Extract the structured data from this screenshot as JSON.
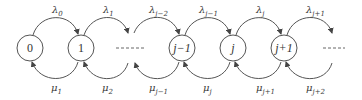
{
  "diagram": {
    "type": "birth-death-state-transition",
    "nodes": [
      {
        "id": "n0",
        "label": "0",
        "italic": false
      },
      {
        "id": "n1",
        "label": "1",
        "italic": false
      },
      {
        "id": "gap1",
        "label": "------",
        "ellipsis": true
      },
      {
        "id": "njm1",
        "label": "j−1",
        "italic": true
      },
      {
        "id": "nj",
        "label": "j",
        "italic": true
      },
      {
        "id": "njp1",
        "label": "j+1",
        "italic": true
      },
      {
        "id": "gap2",
        "label": "-----",
        "ellipsis": true
      }
    ],
    "forward_rates": [
      {
        "symbol": "λ",
        "sub": "0"
      },
      {
        "symbol": "λ",
        "sub": "1"
      },
      {
        "symbol": "λ",
        "sub": "j−2"
      },
      {
        "symbol": "λ",
        "sub": "j−1"
      },
      {
        "symbol": "λ",
        "sub": "j"
      },
      {
        "symbol": "λ",
        "sub": "j+1"
      }
    ],
    "backward_rates": [
      {
        "symbol": "μ",
        "sub": "1"
      },
      {
        "symbol": "μ",
        "sub": "2"
      },
      {
        "symbol": "μ",
        "sub": "j−1"
      },
      {
        "symbol": "μ",
        "sub": "j"
      },
      {
        "symbol": "μ",
        "sub": "j+1"
      },
      {
        "symbol": "μ",
        "sub": "j+2"
      }
    ],
    "colors": {
      "stroke": "#555555",
      "text": "#333333",
      "background": "#ffffff"
    }
  }
}
